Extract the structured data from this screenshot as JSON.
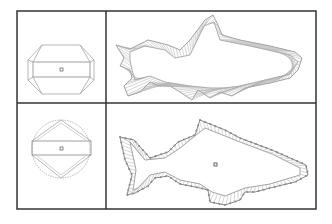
{
  "figure": {
    "rows": [
      {
        "name": "octagon-to-fish",
        "source_shape": "octagon",
        "target_shape": "fish-with-fins"
      },
      {
        "name": "circle-to-fish",
        "source_shape": "circle",
        "target_shape": "fish-with-points"
      }
    ],
    "colors": {
      "frame": "#333333",
      "outline": "#888888",
      "hatch": "#9a9a9a",
      "point": "#777777"
    }
  }
}
